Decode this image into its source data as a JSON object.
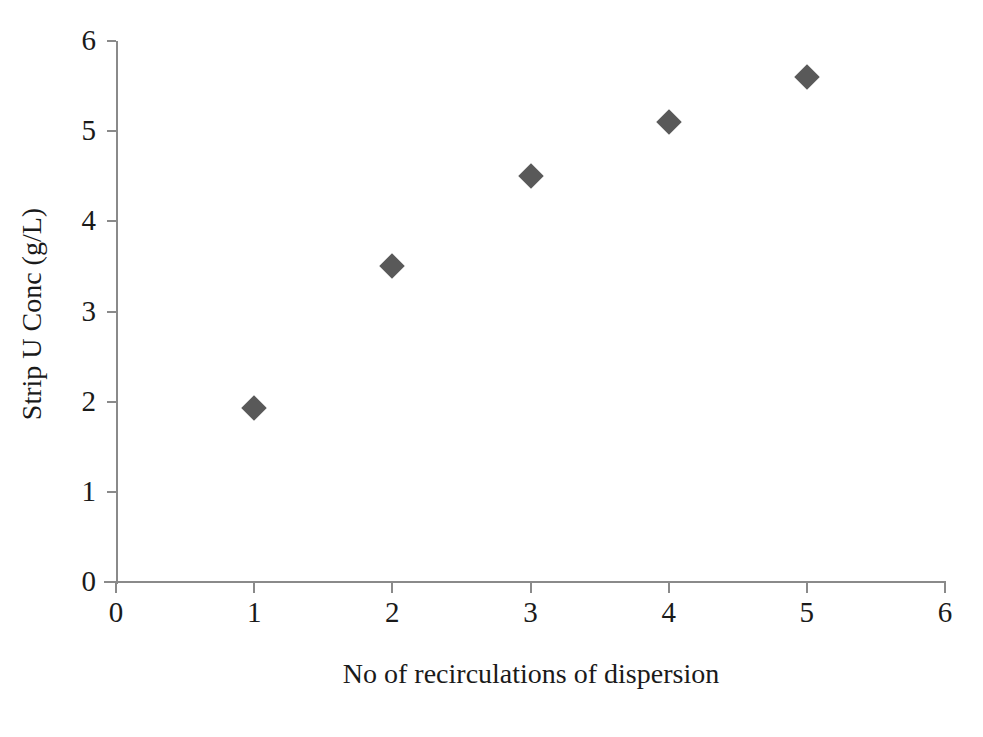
{
  "chart_data": {
    "type": "scatter",
    "title": "",
    "xlabel": "No of recirculations of dispersion",
    "ylabel": "Strip U Conc (g/L)",
    "x": [
      1,
      2,
      3,
      4,
      5
    ],
    "values": [
      1.93,
      3.5,
      4.5,
      5.1,
      5.6
    ],
    "series": [
      {
        "name": "Strip U Conc",
        "x": [
          1,
          2,
          3,
          4,
          5
        ],
        "values": [
          1.93,
          3.5,
          4.5,
          5.1,
          5.6
        ],
        "marker": "diamond",
        "color": "#595959"
      }
    ],
    "xlim": [
      0,
      6
    ],
    "ylim": [
      0,
      6
    ],
    "x_ticks": [
      0,
      1,
      2,
      3,
      4,
      5,
      6
    ],
    "y_ticks": [
      0,
      1,
      2,
      3,
      4,
      5,
      6
    ],
    "x_tick_labels": [
      "0",
      "1",
      "2",
      "3",
      "4",
      "5",
      "6"
    ],
    "y_tick_labels": [
      "0",
      "1",
      "2",
      "3",
      "4",
      "5",
      "6"
    ],
    "grid": false,
    "legend": false,
    "legend_position": "none",
    "axis_color": "#8a8a8a",
    "background": "#ffffff"
  }
}
